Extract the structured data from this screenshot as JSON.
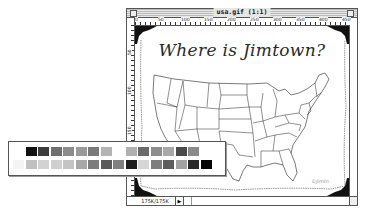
{
  "window": {
    "title": "usa.gif (1:1)",
    "status_size": "175K/175K",
    "status_arrow": "▶"
  },
  "rulers": {
    "horizontal_ticks": [
      "0",
      "50",
      "100",
      "150",
      "200",
      "250",
      "300",
      "350",
      "400",
      "450"
    ],
    "vertical_ticks": [
      "50",
      "100",
      "150",
      "200"
    ]
  },
  "image": {
    "heading": "Where is Jimtown?",
    "signature": "©Jimtn",
    "description": "Outline map of the continental United States with state borders, framed with black photo corners"
  },
  "palette": {
    "row1": [
      "#ffffff",
      "#111111",
      "#3c3c3c",
      "#6e6e6e",
      "#8c8c8c",
      "#9a9a9a",
      "#7a7a7a",
      "#b4b4b4",
      "#ffffff",
      "#b0b0b0",
      "#6a6a6a",
      "#8e8e8e",
      "#a8a8a8",
      "#4a4a4a",
      "#8a8a8a",
      "#ffffff"
    ],
    "row2": [
      "#f4f4f4",
      "#c0c0c0",
      "#d2d2d2",
      "#cfcfcf",
      "#c4c4c4",
      "#a8a8a8",
      "#7c7c7c",
      "#5a5a5a",
      "#808080",
      "#1e1e1e",
      "#d6d6d6",
      "#7e7e7e",
      "#5c5c5c",
      "#a2a2a2",
      "#2a2a2a",
      "#060606"
    ]
  }
}
